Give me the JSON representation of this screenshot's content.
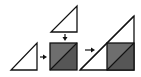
{
  "diagram": {
    "colors": {
      "background": "#ffffff",
      "stroke": "#111111",
      "triangle_fill": "#ffffff",
      "square_upper": "#6e6e6e",
      "square_lower": "#565656",
      "arrow": "#111111"
    },
    "steps": [
      {
        "id": "small-triangle-left",
        "shape": "right-triangle"
      },
      {
        "id": "small-triangle-top",
        "shape": "right-triangle"
      },
      {
        "id": "split-square",
        "shape": "square-with-diagonal"
      },
      {
        "id": "combined-triangle",
        "shape": "right-triangle-with-square"
      }
    ],
    "arrows": [
      {
        "id": "arrow-left-to-square",
        "direction": "right"
      },
      {
        "id": "arrow-top-to-square",
        "direction": "down"
      },
      {
        "id": "arrow-square-to-combined",
        "direction": "right"
      }
    ]
  }
}
